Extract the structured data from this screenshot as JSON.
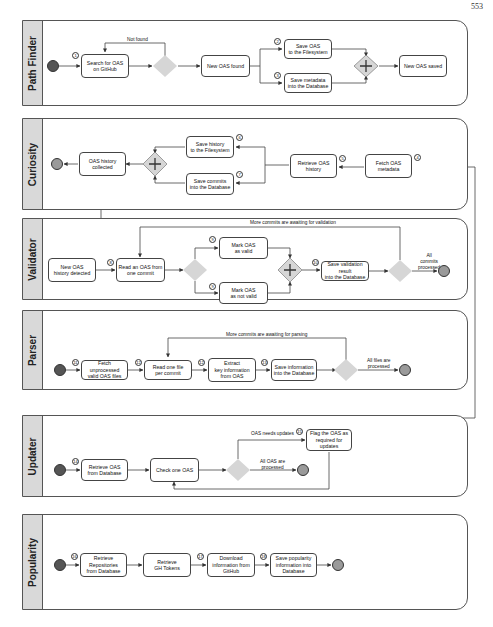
{
  "page_number": "553",
  "lanes": [
    {
      "title": "Path Finder",
      "tasks": [
        {
          "label": "Search for OAS\non GitHub",
          "badge": "1"
        },
        {
          "label": "New OAS found"
        },
        {
          "label": "Save OAS\nto the Filesystem",
          "badge": "2"
        },
        {
          "label": "Save metadata\ninto the Database",
          "badge": "3"
        },
        {
          "label": "New OAS saved"
        }
      ],
      "edge_labels": [
        "Not found"
      ]
    },
    {
      "title": "Curiosity",
      "tasks": [
        {
          "label": "OAS history\ncollected"
        },
        {
          "label": "Save history\nto the Filesystem",
          "badge": "6"
        },
        {
          "label": "Save commits\ninto the Database",
          "badge": "7"
        },
        {
          "label": "Retrieve OAS\nhistory",
          "badge": "5"
        },
        {
          "label": "Fetch OAS\nmetadata",
          "badge": "4"
        }
      ]
    },
    {
      "title": "Validator",
      "tasks": [
        {
          "label": "New OAS\nhistory detected"
        },
        {
          "label": "Read an OAS from\none commit",
          "badge": "8"
        },
        {
          "label": "Mark OAS\nas valid",
          "badge": "9"
        },
        {
          "label": "Mark OAS\nas not valid",
          "badge": "9"
        },
        {
          "label": "Save validation result\ninto the Database",
          "badge": "10"
        }
      ],
      "edge_labels": [
        "More commits are awaiting for validation",
        "All\ncommits\nprocessed"
      ]
    },
    {
      "title": "Parser",
      "tasks": [
        {
          "label": "Fetch unprocessed\nvalid OAS files",
          "badge": "11"
        },
        {
          "label": "Read one file\nper commit",
          "badge": "12"
        },
        {
          "label": "Extract\nkey information\nfrom OAS",
          "badge": "12"
        },
        {
          "label": "Save information\ninto the Database",
          "badge": "13"
        }
      ],
      "edge_labels": [
        "More commits are awaiting for parsing",
        "All files are\nprocessed"
      ]
    },
    {
      "title": "Updater",
      "tasks": [
        {
          "label": "Retrieve OAS\nfrom Database",
          "badge": "14"
        },
        {
          "label": "Check one OAS"
        },
        {
          "label": "Flag the OAS as\nrequired for updates",
          "badge": "15"
        }
      ],
      "edge_labels": [
        "OAS needs updates",
        "All OAS are\nprocessed"
      ]
    },
    {
      "title": "Popularity",
      "tasks": [
        {
          "label": "Retrieve\nRepositories\nfrom Database",
          "badge": "16"
        },
        {
          "label": "Retrieve\nGH Tokens"
        },
        {
          "label": "Download\ninformation from\nGitHub",
          "badge": "17"
        },
        {
          "label": "Save popularity\ninformation into\nDatabase",
          "badge": "18"
        }
      ]
    }
  ],
  "colors": {
    "gateway": "#d6d6d6",
    "start": "#555555",
    "end": "#9a9a9a",
    "lane_header": "#d9d9d9",
    "line": "#444444"
  }
}
